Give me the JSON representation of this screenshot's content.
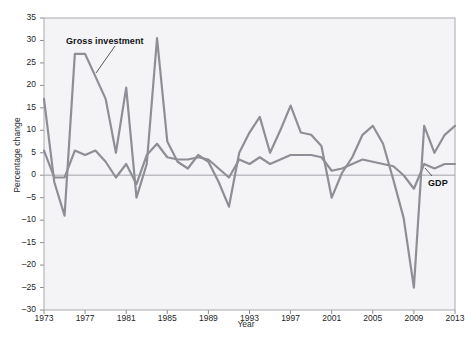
{
  "figure": {
    "top_note": "",
    "bottom_note": ""
  },
  "axes": {
    "ylabel": "Percentage change",
    "xlabel": "Year",
    "yticks": [
      "35",
      "30",
      "25",
      "20",
      "15",
      "10",
      "5",
      "0",
      "–5",
      "–10",
      "–15",
      "–20",
      "–25",
      "–30"
    ],
    "xticks": [
      "1973",
      "1977",
      "1981",
      "1985",
      "1989",
      "1993",
      "1997",
      "2001",
      "2005",
      "2009",
      "2013"
    ]
  },
  "labels": {
    "gross_investment": "Gross investment",
    "gdp": "GDP"
  },
  "colors": {
    "plot_background": "#f4f4f7",
    "series_line": "#8e8e96",
    "zero_line": "#bdbdc4",
    "frame": "#a8a8b0",
    "text": "#262629"
  },
  "chart_data": {
    "type": "line",
    "title": "",
    "xlabel": "Year",
    "ylabel": "Percentage change",
    "xlim": [
      1973,
      2013
    ],
    "ylim": [
      -30,
      35
    ],
    "grid": false,
    "legend": "inline-annotations",
    "x": [
      1973,
      1974,
      1975,
      1976,
      1977,
      1978,
      1979,
      1980,
      1981,
      1982,
      1983,
      1984,
      1985,
      1986,
      1987,
      1988,
      1989,
      1990,
      1991,
      1992,
      1993,
      1994,
      1995,
      1996,
      1997,
      1998,
      1999,
      2000,
      2001,
      2002,
      2003,
      2004,
      2005,
      2006,
      2007,
      2008,
      2009,
      2010,
      2011,
      2012,
      2013
    ],
    "series": [
      {
        "name": "Gross investment",
        "values": [
          17.0,
          -1.5,
          -9.0,
          27.0,
          27.0,
          22.0,
          17.0,
          5.0,
          19.5,
          -5.0,
          2.5,
          30.5,
          7.5,
          3.0,
          1.5,
          4.5,
          3.0,
          -1.5,
          -7.0,
          5.0,
          9.5,
          13.0,
          5.0,
          10.0,
          15.5,
          9.5,
          9.0,
          6.5,
          -5.0,
          0.5,
          4.0,
          9.0,
          11.0,
          7.0,
          -1.0,
          -9.5,
          -25.0,
          11.0,
          5.0,
          9.0,
          11.0
        ]
      },
      {
        "name": "GDP",
        "values": [
          5.5,
          -0.5,
          -0.5,
          5.5,
          4.5,
          5.5,
          3.0,
          -0.5,
          2.5,
          -2.0,
          4.5,
          7.0,
          4.0,
          3.5,
          3.5,
          4.0,
          3.5,
          1.5,
          -0.5,
          3.5,
          2.5,
          4.0,
          2.5,
          3.5,
          4.5,
          4.5,
          4.5,
          4.0,
          1.0,
          1.5,
          2.5,
          3.5,
          3.0,
          2.5,
          2.0,
          0.0,
          -3.0,
          2.5,
          1.5,
          2.5,
          2.5
        ]
      }
    ]
  }
}
